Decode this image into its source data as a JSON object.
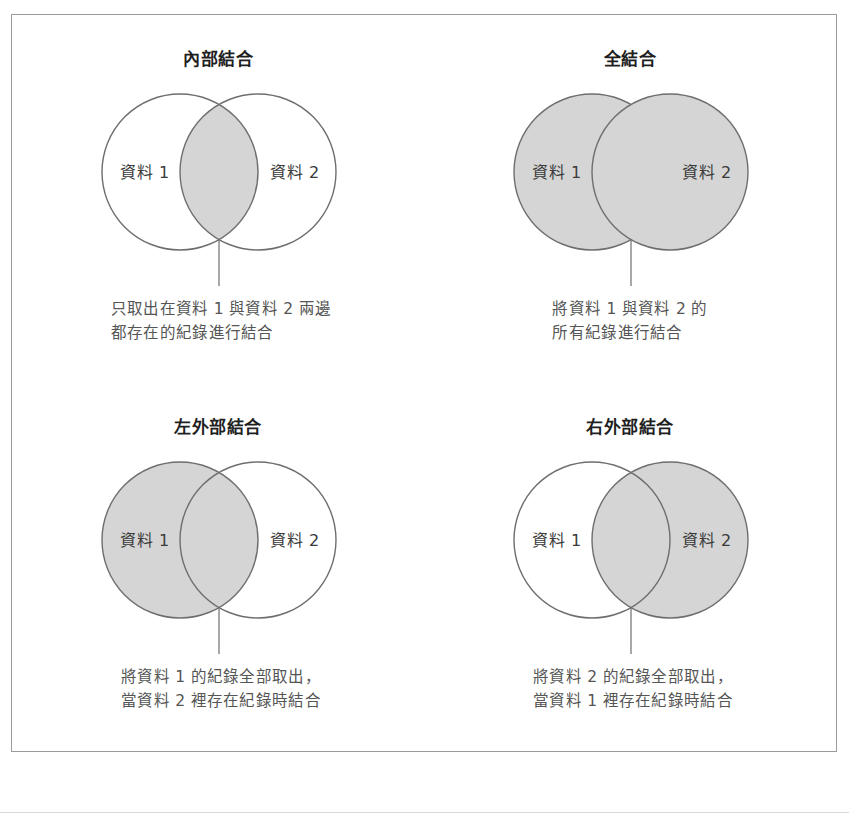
{
  "figure": {
    "shade_color": "#d5d5d5",
    "stroke_color": "#6e6e6e",
    "border_color": "#9a9a9a",
    "title_color": "#1f1f1f",
    "caption_color": "#555555",
    "label_left": "資料 1",
    "label_right": "資料 2"
  },
  "panels": [
    {
      "id": "inner-join",
      "title": "內部結合",
      "label_left": "資料 1",
      "label_right": "資料 2",
      "shaded": "intersection",
      "caption": "只取出在資料 1 與資料 2 兩邊\n都存在的紀錄進行結合"
    },
    {
      "id": "full-join",
      "title": "全結合",
      "label_left": "資料 1",
      "label_right": "資料 2",
      "shaded": "both",
      "caption": "將資料 1 與資料 2 的\n所有紀錄進行結合"
    },
    {
      "id": "left-outer-join",
      "title": "左外部結合",
      "label_left": "資料 1",
      "label_right": "資料 2",
      "shaded": "left",
      "caption": "將資料 1 的紀錄全部取出，\n當資料 2 裡存在紀錄時結合"
    },
    {
      "id": "right-outer-join",
      "title": "右外部結合",
      "label_left": "資料 1",
      "label_right": "資料 2",
      "shaded": "right",
      "caption": "將資料 2 的紀錄全部取出，\n當資料 1 裡存在紀錄時結合"
    }
  ],
  "bottom_sliver": {
    "text": " "
  }
}
